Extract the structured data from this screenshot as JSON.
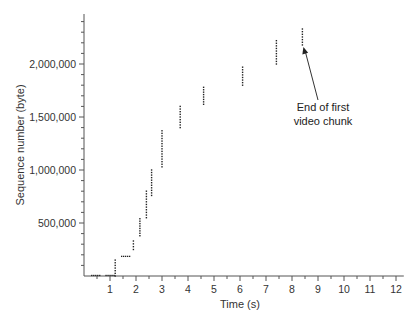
{
  "chart_data": {
    "type": "scatter",
    "title": "",
    "xlabel": "Time (s)",
    "ylabel": "Sequence number (byte)",
    "xlim": [
      0,
      12.3
    ],
    "ylim": [
      0,
      2450000
    ],
    "x_ticks": [
      1,
      2,
      3,
      4,
      5,
      6,
      7,
      8,
      9,
      10,
      11,
      12
    ],
    "x_tick_labels": [
      "1",
      "2",
      "3",
      "4",
      "5",
      "6",
      "7",
      "8",
      "9",
      "10",
      "11",
      "12"
    ],
    "y_ticks": [
      500000,
      1000000,
      1500000,
      2000000
    ],
    "y_tick_labels": [
      "500,000",
      "1,000,000",
      "1,500,000",
      "2,000,000"
    ],
    "grid": false,
    "legend": null,
    "series": [
      {
        "name": "TCP sequence numbers",
        "clusters": [
          {
            "t": 0.45,
            "seq_start": 0,
            "seq_end": 10000
          },
          {
            "t": 1.0,
            "seq_start": 0,
            "seq_end": 10000
          },
          {
            "t": 1.2,
            "seq_start": 0,
            "seq_end": 150000
          },
          {
            "t": 1.6,
            "seq_start": 180000,
            "seq_end": 200000
          },
          {
            "t": 1.9,
            "seq_start": 250000,
            "seq_end": 330000
          },
          {
            "t": 2.15,
            "seq_start": 380000,
            "seq_end": 540000
          },
          {
            "t": 2.4,
            "seq_start": 550000,
            "seq_end": 800000
          },
          {
            "t": 2.6,
            "seq_start": 760000,
            "seq_end": 1000000
          },
          {
            "t": 3.0,
            "seq_start": 1030000,
            "seq_end": 1370000
          },
          {
            "t": 3.7,
            "seq_start": 1400000,
            "seq_end": 1600000
          },
          {
            "t": 4.6,
            "seq_start": 1620000,
            "seq_end": 1780000
          },
          {
            "t": 6.1,
            "seq_start": 1800000,
            "seq_end": 1970000
          },
          {
            "t": 7.4,
            "seq_start": 2000000,
            "seq_end": 2220000
          },
          {
            "t": 8.4,
            "seq_start": 2180000,
            "seq_end": 2330000
          }
        ]
      }
    ],
    "annotations": [
      {
        "text": "End of first video chunk",
        "lines": [
          "End of first",
          "video chunk"
        ],
        "points_to": {
          "t": 8.4,
          "seq": 2180000
        }
      }
    ]
  }
}
